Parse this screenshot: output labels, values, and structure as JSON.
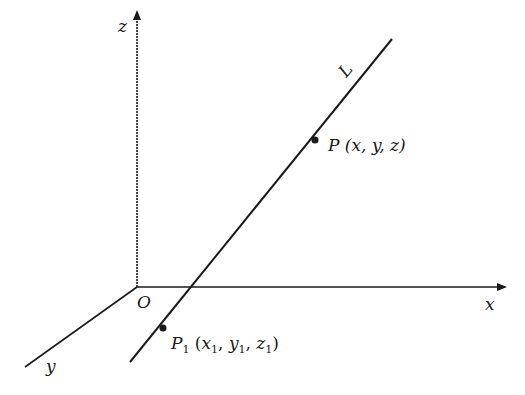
{
  "diagram": {
    "axes": {
      "x_label": "x",
      "y_label": "y",
      "z_label": "z",
      "origin_label": "O"
    },
    "line_label": "L",
    "point_p": {
      "name": "P",
      "coords_text": "(x, y, z)"
    },
    "point_p1": {
      "name": "P",
      "name_sub": "1",
      "open": "(",
      "x": "x",
      "x_sub": "1",
      "y": "y",
      "y_sub": "1",
      "z": "z",
      "z_sub": "1",
      "close": ")",
      "sep": ", "
    },
    "colors": {
      "stroke": "#1a1a1a",
      "background": "#ffffff"
    }
  }
}
